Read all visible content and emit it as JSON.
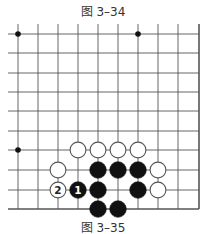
{
  "captions": {
    "top": "图 3–34",
    "bottom": "图 3–35"
  },
  "board": {
    "columns_x": [
      18,
      38,
      58,
      78,
      98,
      118,
      138,
      158,
      178,
      199
    ],
    "rows_y": [
      34,
      53,
      73,
      92,
      111,
      131,
      150,
      170,
      190,
      209
    ],
    "left_extent_x": 8,
    "top_extent_y": 24,
    "right_edge": true,
    "bottom_edge": true,
    "line_color": "#555555",
    "star_points": [
      {
        "col": 0,
        "row": 0
      },
      {
        "col": 6,
        "row": 0
      },
      {
        "col": 0,
        "row": 6
      }
    ],
    "stones": [
      {
        "color": "white",
        "col": 3,
        "row": 6
      },
      {
        "color": "white",
        "col": 4,
        "row": 6
      },
      {
        "color": "white",
        "col": 5,
        "row": 6
      },
      {
        "color": "white",
        "col": 6,
        "row": 6
      },
      {
        "color": "white",
        "col": 2,
        "row": 7
      },
      {
        "color": "black",
        "col": 4,
        "row": 7
      },
      {
        "color": "black",
        "col": 5,
        "row": 7
      },
      {
        "color": "black",
        "col": 6,
        "row": 7
      },
      {
        "color": "white",
        "col": 7,
        "row": 7
      },
      {
        "color": "white",
        "col": 2,
        "row": 8,
        "label": "2"
      },
      {
        "color": "black",
        "col": 3,
        "row": 8,
        "label": "1"
      },
      {
        "color": "black",
        "col": 4,
        "row": 8
      },
      {
        "color": "black",
        "col": 6,
        "row": 8
      },
      {
        "color": "white",
        "col": 7,
        "row": 8
      },
      {
        "color": "black",
        "col": 4,
        "row": 9
      },
      {
        "color": "black",
        "col": 5,
        "row": 9
      }
    ]
  }
}
